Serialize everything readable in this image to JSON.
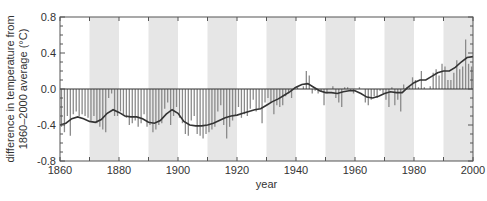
{
  "chart_data": {
    "type": "bar",
    "title": "",
    "xlabel": "year",
    "ylabel": "difference in temperature from 1860–2000 average (°C)",
    "ylabel_lines": [
      "difference in temperature from",
      "1860–2000 average (°C)"
    ],
    "xlim": [
      1860,
      2000
    ],
    "ylim": [
      -0.8,
      0.8
    ],
    "x_ticks": [
      1860,
      1880,
      1900,
      1920,
      1940,
      1960,
      1980,
      2000
    ],
    "x_tick_labels": [
      "1860",
      "1880",
      "1900",
      "1920",
      "1940",
      "1960",
      "1980",
      "2000"
    ],
    "y_ticks": [
      0.8,
      0.4,
      0.0,
      -0.4,
      -0.8
    ],
    "y_tick_labels": [
      "0.8",
      "0.4",
      "0.0",
      "-0.4",
      "-0.8"
    ],
    "shaded_bands": [
      [
        1870,
        1880
      ],
      [
        1890,
        1900
      ],
      [
        1910,
        1920
      ],
      [
        1930,
        1940
      ],
      [
        1950,
        1960
      ],
      [
        1970,
        1980
      ],
      [
        1990,
        2000
      ]
    ],
    "grid": false,
    "legend": null,
    "colors": {
      "bars": "#8a8a8a",
      "smooth_line": "#333333",
      "band": "#e6e6e6",
      "axis": "#444444"
    },
    "series": [
      {
        "name": "annual anomaly",
        "type": "bar",
        "x": [
          1861,
          1862,
          1863,
          1864,
          1865,
          1866,
          1867,
          1868,
          1869,
          1870,
          1871,
          1872,
          1873,
          1874,
          1875,
          1876,
          1877,
          1878,
          1879,
          1880,
          1881,
          1882,
          1883,
          1884,
          1885,
          1886,
          1887,
          1888,
          1889,
          1890,
          1891,
          1892,
          1893,
          1894,
          1895,
          1896,
          1897,
          1898,
          1899,
          1900,
          1901,
          1902,
          1903,
          1904,
          1905,
          1906,
          1907,
          1908,
          1909,
          1910,
          1911,
          1912,
          1913,
          1914,
          1915,
          1916,
          1917,
          1918,
          1919,
          1920,
          1921,
          1922,
          1923,
          1924,
          1925,
          1926,
          1927,
          1928,
          1929,
          1930,
          1931,
          1932,
          1933,
          1934,
          1935,
          1936,
          1937,
          1938,
          1939,
          1940,
          1941,
          1942,
          1943,
          1944,
          1945,
          1946,
          1947,
          1948,
          1949,
          1950,
          1951,
          1952,
          1953,
          1954,
          1955,
          1956,
          1957,
          1958,
          1959,
          1960,
          1961,
          1962,
          1963,
          1964,
          1965,
          1966,
          1967,
          1968,
          1969,
          1970,
          1971,
          1972,
          1973,
          1974,
          1975,
          1976,
          1977,
          1978,
          1979,
          1980,
          1981,
          1982,
          1983,
          1984,
          1985,
          1986,
          1987,
          1988,
          1989,
          1990,
          1991,
          1992,
          1993,
          1994,
          1995,
          1996,
          1997,
          1998,
          1999,
          2000
        ],
        "values": [
          -0.42,
          -0.48,
          -0.3,
          -0.52,
          -0.28,
          -0.25,
          -0.3,
          -0.28,
          -0.3,
          -0.32,
          -0.35,
          -0.3,
          -0.38,
          -0.42,
          -0.45,
          -0.48,
          -0.1,
          -0.05,
          -0.3,
          -0.3,
          -0.25,
          -0.28,
          -0.32,
          -0.4,
          -0.38,
          -0.35,
          -0.42,
          -0.38,
          -0.28,
          -0.42,
          -0.4,
          -0.48,
          -0.45,
          -0.4,
          -0.38,
          -0.22,
          -0.15,
          -0.4,
          -0.3,
          -0.2,
          -0.32,
          -0.38,
          -0.5,
          -0.52,
          -0.35,
          -0.3,
          -0.5,
          -0.52,
          -0.55,
          -0.5,
          -0.48,
          -0.45,
          -0.42,
          -0.25,
          -0.18,
          -0.4,
          -0.55,
          -0.42,
          -0.35,
          -0.3,
          -0.2,
          -0.32,
          -0.28,
          -0.3,
          -0.22,
          -0.12,
          -0.25,
          -0.22,
          -0.38,
          -0.15,
          -0.1,
          -0.15,
          -0.28,
          -0.18,
          -0.2,
          -0.18,
          -0.08,
          -0.05,
          -0.1,
          0.02,
          0.02,
          0.0,
          0.03,
          0.2,
          0.15,
          -0.05,
          -0.02,
          -0.05,
          -0.03,
          -0.18,
          -0.05,
          0.0,
          0.03,
          -0.1,
          -0.15,
          -0.2,
          0.02,
          0.02,
          -0.02,
          -0.05,
          0.0,
          0.02,
          0.0,
          -0.15,
          -0.18,
          -0.12,
          -0.08,
          -0.1,
          -0.02,
          -0.05,
          -0.12,
          -0.2,
          0.02,
          -0.18,
          -0.12,
          -0.25,
          0.05,
          0.02,
          0.02,
          0.13,
          0.1,
          0.02,
          0.2,
          0.02,
          0.0,
          0.03,
          0.18,
          0.22,
          0.15,
          0.28,
          0.25,
          0.1,
          0.1,
          0.18,
          0.32,
          0.22,
          0.25,
          0.55,
          0.28,
          0.25
        ],
        "bar_years_note": "bars drawn from 0.0 baseline"
      },
      {
        "name": "smoothed trend",
        "type": "line",
        "x": [
          1860,
          1862,
          1864,
          1866,
          1868,
          1870,
          1872,
          1874,
          1876,
          1878,
          1880,
          1882,
          1884,
          1886,
          1888,
          1890,
          1892,
          1894,
          1896,
          1898,
          1900,
          1902,
          1904,
          1906,
          1908,
          1910,
          1912,
          1914,
          1916,
          1918,
          1920,
          1922,
          1924,
          1926,
          1928,
          1930,
          1932,
          1934,
          1936,
          1938,
          1940,
          1942,
          1944,
          1946,
          1948,
          1950,
          1952,
          1954,
          1956,
          1958,
          1960,
          1962,
          1964,
          1966,
          1968,
          1970,
          1972,
          1974,
          1976,
          1978,
          1980,
          1982,
          1984,
          1986,
          1988,
          1990,
          1992,
          1994,
          1996,
          1998,
          2000
        ],
        "values": [
          -0.4,
          -0.38,
          -0.33,
          -0.31,
          -0.33,
          -0.36,
          -0.37,
          -0.34,
          -0.27,
          -0.23,
          -0.26,
          -0.3,
          -0.31,
          -0.31,
          -0.33,
          -0.37,
          -0.38,
          -0.35,
          -0.28,
          -0.23,
          -0.27,
          -0.36,
          -0.4,
          -0.41,
          -0.41,
          -0.4,
          -0.38,
          -0.35,
          -0.32,
          -0.3,
          -0.29,
          -0.27,
          -0.25,
          -0.23,
          -0.22,
          -0.18,
          -0.14,
          -0.11,
          -0.07,
          -0.03,
          0.02,
          0.05,
          0.06,
          0.02,
          -0.02,
          -0.04,
          -0.04,
          -0.05,
          -0.03,
          -0.02,
          -0.02,
          -0.05,
          -0.09,
          -0.1,
          -0.08,
          -0.05,
          -0.03,
          -0.04,
          -0.04,
          0.02,
          0.07,
          0.1,
          0.1,
          0.14,
          0.18,
          0.2,
          0.2,
          0.24,
          0.3,
          0.35,
          0.36
        ]
      }
    ]
  }
}
